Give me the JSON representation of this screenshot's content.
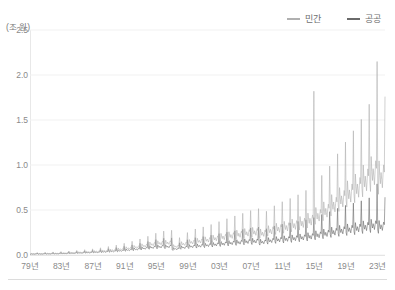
{
  "chart_data": {
    "type": "line",
    "title": "",
    "subtitle": "",
    "xlabel": "",
    "ylabel": "(조 원)",
    "unit_note": "(조 원)",
    "grid": true,
    "legend_position": "top-right",
    "xlim": [
      1979,
      2023.92
    ],
    "ylim": [
      0.0,
      2.5
    ],
    "yticks": [
      "0.0",
      "0.5",
      "1.0",
      "1.5",
      "2.0",
      "2.5"
    ],
    "ytick_values": [
      0.0,
      0.5,
      1.0,
      1.5,
      2.0,
      2.5
    ],
    "xticks": [
      "79년",
      "83년",
      "87년",
      "91년",
      "95년",
      "99년",
      "03년",
      "07년",
      "11년",
      "15년",
      "19년",
      "23년"
    ],
    "xtick_values": [
      1979,
      1983,
      1987,
      1991,
      1995,
      1999,
      2003,
      2007,
      2011,
      2015,
      2019,
      2023
    ],
    "frequency": "monthly",
    "series": [
      {
        "name": "민간",
        "color": "#b0b0b0",
        "values": [
          0.012,
          0.01,
          0.016,
          0.014,
          0.012,
          0.015,
          0.013,
          0.011,
          0.014,
          0.016,
          0.015,
          0.028,
          0.013,
          0.011,
          0.017,
          0.015,
          0.013,
          0.016,
          0.014,
          0.012,
          0.015,
          0.017,
          0.016,
          0.03,
          0.015,
          0.013,
          0.019,
          0.017,
          0.015,
          0.018,
          0.016,
          0.014,
          0.017,
          0.019,
          0.018,
          0.034,
          0.017,
          0.015,
          0.022,
          0.019,
          0.017,
          0.02,
          0.018,
          0.016,
          0.019,
          0.022,
          0.02,
          0.038,
          0.02,
          0.017,
          0.026,
          0.022,
          0.02,
          0.023,
          0.021,
          0.019,
          0.022,
          0.025,
          0.023,
          0.044,
          0.023,
          0.02,
          0.03,
          0.026,
          0.023,
          0.027,
          0.024,
          0.022,
          0.026,
          0.029,
          0.027,
          0.051,
          0.026,
          0.023,
          0.035,
          0.03,
          0.027,
          0.031,
          0.028,
          0.025,
          0.03,
          0.034,
          0.031,
          0.059,
          0.031,
          0.027,
          0.041,
          0.035,
          0.031,
          0.036,
          0.033,
          0.029,
          0.035,
          0.039,
          0.036,
          0.068,
          0.036,
          0.031,
          0.048,
          0.041,
          0.036,
          0.042,
          0.038,
          0.034,
          0.041,
          0.046,
          0.042,
          0.08,
          0.042,
          0.037,
          0.056,
          0.048,
          0.042,
          0.049,
          0.045,
          0.04,
          0.048,
          0.054,
          0.049,
          0.094,
          0.05,
          0.043,
          0.066,
          0.056,
          0.05,
          0.058,
          0.053,
          0.047,
          0.056,
          0.063,
          0.058,
          0.11,
          0.058,
          0.051,
          0.078,
          0.066,
          0.059,
          0.068,
          0.062,
          0.055,
          0.066,
          0.074,
          0.068,
          0.13,
          0.068,
          0.059,
          0.091,
          0.077,
          0.069,
          0.08,
          0.073,
          0.065,
          0.078,
          0.087,
          0.08,
          0.152,
          0.079,
          0.069,
          0.106,
          0.09,
          0.08,
          0.093,
          0.085,
          0.076,
          0.091,
          0.102,
          0.093,
          0.178,
          0.092,
          0.08,
          0.124,
          0.105,
          0.093,
          0.108,
          0.099,
          0.088,
          0.106,
          0.119,
          0.109,
          0.208,
          0.107,
          0.093,
          0.144,
          0.122,
          0.109,
          0.126,
          0.115,
          0.103,
          0.123,
          0.138,
          0.127,
          0.242,
          0.118,
          0.102,
          0.158,
          0.134,
          0.12,
          0.139,
          0.127,
          0.113,
          0.136,
          0.152,
          0.14,
          0.266,
          0.122,
          0.106,
          0.164,
          0.139,
          0.124,
          0.144,
          0.131,
          0.117,
          0.14,
          0.157,
          0.145,
          0.275,
          0.085,
          0.074,
          0.115,
          0.097,
          0.087,
          0.101,
          0.092,
          0.082,
          0.098,
          0.11,
          0.101,
          0.193,
          0.11,
          0.096,
          0.148,
          0.126,
          0.112,
          0.13,
          0.119,
          0.106,
          0.127,
          0.142,
          0.131,
          0.249,
          0.128,
          0.111,
          0.172,
          0.146,
          0.13,
          0.151,
          0.138,
          0.123,
          0.147,
          0.165,
          0.152,
          0.289,
          0.138,
          0.12,
          0.186,
          0.158,
          0.141,
          0.163,
          0.149,
          0.133,
          0.159,
          0.178,
          0.164,
          0.312,
          0.15,
          0.13,
          0.202,
          0.171,
          0.153,
          0.177,
          0.162,
          0.144,
          0.173,
          0.194,
          0.178,
          0.339,
          0.164,
          0.143,
          0.221,
          0.187,
          0.167,
          0.194,
          0.177,
          0.158,
          0.189,
          0.212,
          0.195,
          0.371,
          0.178,
          0.155,
          0.24,
          0.203,
          0.182,
          0.211,
          0.192,
          0.171,
          0.205,
          0.23,
          0.211,
          0.403,
          0.192,
          0.167,
          0.258,
          0.219,
          0.196,
          0.227,
          0.207,
          0.185,
          0.221,
          0.248,
          0.228,
          0.434,
          0.205,
          0.178,
          0.276,
          0.234,
          0.209,
          0.242,
          0.221,
          0.197,
          0.236,
          0.265,
          0.243,
          0.463,
          0.218,
          0.19,
          0.294,
          0.249,
          0.223,
          0.258,
          0.236,
          0.21,
          0.252,
          0.282,
          0.259,
          0.494,
          0.228,
          0.198,
          0.307,
          0.26,
          0.232,
          0.269,
          0.246,
          0.219,
          0.263,
          0.294,
          0.27,
          0.515,
          0.215,
          0.187,
          0.289,
          0.245,
          0.219,
          0.254,
          0.232,
          0.207,
          0.248,
          0.278,
          0.255,
          0.486,
          0.242,
          0.211,
          0.326,
          0.276,
          0.247,
          0.286,
          0.261,
          0.233,
          0.279,
          0.313,
          0.287,
          0.547,
          0.262,
          0.228,
          0.353,
          0.299,
          0.267,
          0.31,
          0.283,
          0.252,
          0.302,
          0.338,
          0.311,
          0.592,
          0.278,
          0.242,
          0.374,
          0.317,
          0.283,
          0.328,
          0.3,
          0.267,
          0.32,
          0.359,
          0.33,
          0.628,
          0.296,
          0.258,
          0.399,
          0.338,
          0.302,
          0.35,
          0.319,
          0.285,
          0.341,
          0.382,
          0.351,
          0.669,
          0.318,
          0.277,
          0.428,
          0.363,
          0.324,
          0.376,
          0.343,
          0.306,
          0.366,
          0.41,
          0.377,
          0.718,
          0.345,
          0.3,
          0.465,
          0.394,
          0.352,
          0.408,
          0.372,
          0.332,
          0.397,
          0.445,
          0.409,
          1.82,
          0.392,
          0.341,
          0.528,
          0.447,
          0.399,
          0.463,
          0.423,
          0.377,
          0.451,
          0.505,
          0.464,
          0.884,
          0.438,
          0.381,
          0.59,
          0.5,
          0.447,
          0.518,
          0.473,
          0.421,
          0.504,
          0.565,
          0.519,
          0.988,
          0.498,
          0.433,
          0.671,
          0.568,
          0.508,
          0.589,
          0.537,
          0.479,
          0.573,
          0.642,
          0.59,
          1.124,
          0.556,
          0.484,
          0.749,
          0.634,
          0.567,
          0.657,
          0.6,
          0.535,
          0.64,
          0.717,
          0.659,
          1.255,
          0.612,
          0.532,
          0.824,
          0.698,
          0.624,
          0.723,
          0.66,
          0.588,
          0.704,
          0.789,
          0.725,
          1.38,
          0.668,
          0.581,
          0.9,
          0.762,
          0.681,
          0.789,
          0.721,
          0.642,
          0.769,
          0.861,
          0.792,
          1.507,
          0.742,
          0.646,
          1.0,
          0.847,
          0.757,
          0.877,
          0.801,
          0.714,
          0.854,
          0.957,
          0.88,
          1.675,
          0.812,
          0.706,
          1.094,
          0.926,
          0.828,
          0.959,
          0.876,
          0.781,
          0.935,
          1.047,
          0.963,
          2.15,
          0.776,
          0.675,
          1.046,
          0.886,
          0.792,
          0.917,
          0.838,
          0.747,
          0.894,
          1.001,
          0.921,
          1.76
        ]
      },
      {
        "name": "공공",
        "color": "#6a6a6a",
        "values": [
          0.009,
          0.008,
          0.013,
          0.011,
          0.009,
          0.011,
          0.01,
          0.009,
          0.011,
          0.012,
          0.011,
          0.022,
          0.01,
          0.009,
          0.014,
          0.012,
          0.01,
          0.012,
          0.011,
          0.01,
          0.012,
          0.013,
          0.012,
          0.024,
          0.011,
          0.01,
          0.016,
          0.013,
          0.012,
          0.014,
          0.012,
          0.011,
          0.013,
          0.015,
          0.014,
          0.027,
          0.013,
          0.011,
          0.018,
          0.015,
          0.013,
          0.015,
          0.014,
          0.012,
          0.015,
          0.017,
          0.015,
          0.03,
          0.015,
          0.013,
          0.021,
          0.017,
          0.015,
          0.018,
          0.016,
          0.014,
          0.017,
          0.019,
          0.018,
          0.035,
          0.017,
          0.015,
          0.024,
          0.02,
          0.018,
          0.021,
          0.019,
          0.017,
          0.02,
          0.022,
          0.021,
          0.04,
          0.02,
          0.017,
          0.028,
          0.023,
          0.021,
          0.024,
          0.022,
          0.019,
          0.023,
          0.026,
          0.024,
          0.046,
          0.023,
          0.02,
          0.032,
          0.027,
          0.024,
          0.028,
          0.025,
          0.022,
          0.027,
          0.03,
          0.028,
          0.053,
          0.027,
          0.023,
          0.037,
          0.031,
          0.028,
          0.032,
          0.029,
          0.026,
          0.031,
          0.035,
          0.032,
          0.061,
          0.031,
          0.027,
          0.043,
          0.036,
          0.032,
          0.038,
          0.034,
          0.03,
          0.036,
          0.041,
          0.037,
          0.071,
          0.036,
          0.031,
          0.05,
          0.042,
          0.038,
          0.044,
          0.04,
          0.035,
          0.042,
          0.047,
          0.044,
          0.083,
          0.042,
          0.036,
          0.058,
          0.049,
          0.044,
          0.051,
          0.046,
          0.041,
          0.049,
          0.055,
          0.051,
          0.097,
          0.048,
          0.042,
          0.067,
          0.057,
          0.051,
          0.059,
          0.054,
          0.048,
          0.057,
          0.064,
          0.059,
          0.112,
          0.056,
          0.048,
          0.078,
          0.066,
          0.059,
          0.068,
          0.062,
          0.055,
          0.066,
          0.074,
          0.068,
          0.13,
          0.064,
          0.056,
          0.089,
          0.076,
          0.068,
          0.078,
          0.072,
          0.064,
          0.076,
          0.086,
          0.079,
          0.15,
          0.073,
          0.064,
          0.102,
          0.086,
          0.077,
          0.089,
          0.082,
          0.073,
          0.087,
          0.098,
          0.09,
          0.171,
          0.08,
          0.069,
          0.111,
          0.094,
          0.084,
          0.097,
          0.089,
          0.079,
          0.095,
          0.106,
          0.098,
          0.186,
          0.082,
          0.071,
          0.113,
          0.096,
          0.086,
          0.099,
          0.091,
          0.081,
          0.097,
          0.108,
          0.1,
          0.19,
          0.059,
          0.051,
          0.081,
          0.069,
          0.062,
          0.071,
          0.065,
          0.058,
          0.069,
          0.078,
          0.071,
          0.136,
          0.073,
          0.064,
          0.101,
          0.086,
          0.077,
          0.089,
          0.081,
          0.072,
          0.087,
          0.097,
          0.089,
          0.17,
          0.083,
          0.072,
          0.115,
          0.097,
          0.087,
          0.101,
          0.092,
          0.082,
          0.098,
          0.11,
          0.101,
          0.193,
          0.088,
          0.077,
          0.122,
          0.104,
          0.093,
          0.107,
          0.098,
          0.087,
          0.104,
          0.117,
          0.108,
          0.205,
          0.095,
          0.082,
          0.131,
          0.111,
          0.099,
          0.115,
          0.105,
          0.094,
          0.112,
          0.126,
          0.116,
          0.22,
          0.102,
          0.089,
          0.141,
          0.12,
          0.107,
          0.124,
          0.113,
          0.101,
          0.121,
          0.135,
          0.124,
          0.237,
          0.109,
          0.095,
          0.151,
          0.128,
          0.114,
          0.133,
          0.121,
          0.108,
          0.129,
          0.145,
          0.133,
          0.253,
          0.116,
          0.101,
          0.161,
          0.136,
          0.122,
          0.141,
          0.129,
          0.115,
          0.138,
          0.154,
          0.142,
          0.269,
          0.123,
          0.107,
          0.17,
          0.144,
          0.129,
          0.149,
          0.136,
          0.121,
          0.145,
          0.163,
          0.15,
          0.285,
          0.13,
          0.113,
          0.18,
          0.152,
          0.136,
          0.158,
          0.144,
          0.128,
          0.154,
          0.172,
          0.158,
          0.301,
          0.134,
          0.117,
          0.186,
          0.157,
          0.14,
          0.163,
          0.149,
          0.133,
          0.159,
          0.178,
          0.163,
          0.311,
          0.126,
          0.11,
          0.175,
          0.148,
          0.132,
          0.153,
          0.14,
          0.125,
          0.149,
          0.167,
          0.154,
          0.292,
          0.139,
          0.121,
          0.193,
          0.163,
          0.146,
          0.169,
          0.155,
          0.138,
          0.165,
          0.185,
          0.17,
          0.323,
          0.148,
          0.129,
          0.205,
          0.174,
          0.155,
          0.18,
          0.164,
          0.146,
          0.175,
          0.196,
          0.181,
          0.343,
          0.154,
          0.134,
          0.213,
          0.181,
          0.161,
          0.187,
          0.171,
          0.152,
          0.182,
          0.204,
          0.188,
          0.357,
          0.161,
          0.14,
          0.223,
          0.189,
          0.169,
          0.195,
          0.179,
          0.159,
          0.191,
          0.214,
          0.196,
          0.373,
          0.169,
          0.147,
          0.234,
          0.198,
          0.177,
          0.205,
          0.187,
          0.167,
          0.2,
          0.224,
          0.206,
          0.391,
          0.179,
          0.156,
          0.248,
          0.21,
          0.187,
          0.217,
          0.198,
          0.177,
          0.212,
          0.237,
          0.218,
          0.415,
          0.194,
          0.169,
          0.269,
          0.228,
          0.203,
          0.236,
          0.215,
          0.192,
          0.23,
          0.257,
          0.237,
          0.45,
          0.208,
          0.181,
          0.288,
          0.244,
          0.218,
          0.252,
          0.231,
          0.206,
          0.246,
          0.276,
          0.253,
          0.482,
          0.224,
          0.195,
          0.31,
          0.262,
          0.234,
          0.272,
          0.248,
          0.221,
          0.265,
          0.297,
          0.273,
          0.519,
          0.238,
          0.207,
          0.329,
          0.279,
          0.249,
          0.289,
          0.263,
          0.235,
          0.281,
          0.315,
          0.289,
          0.551,
          0.249,
          0.217,
          0.345,
          0.292,
          0.261,
          0.302,
          0.276,
          0.246,
          0.294,
          0.33,
          0.303,
          0.577,
          0.26,
          0.226,
          0.36,
          0.305,
          0.272,
          0.315,
          0.288,
          0.257,
          0.307,
          0.344,
          0.316,
          0.602,
          0.274,
          0.239,
          0.379,
          0.321,
          0.287,
          0.332,
          0.304,
          0.271,
          0.324,
          0.363,
          0.334,
          0.635,
          0.287,
          0.25,
          0.397,
          0.336,
          0.3,
          0.348,
          0.318,
          0.283,
          0.339,
          0.38,
          0.349,
          0.79,
          0.277,
          0.241,
          0.383,
          0.324,
          0.29,
          0.336,
          0.307,
          0.273,
          0.327,
          0.366,
          0.337,
          0.642
        ]
      }
    ]
  },
  "legend": {
    "items": [
      {
        "label": "민간",
        "color": "#b0b0b0"
      },
      {
        "label": "공공",
        "color": "#6a6a6a"
      }
    ]
  }
}
